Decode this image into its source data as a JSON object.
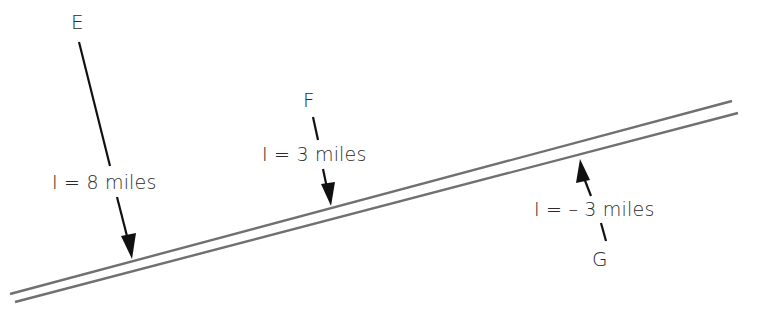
{
  "diagram": {
    "line": {
      "color": "#707070",
      "upper": {
        "x1": 10,
        "y1": 294,
        "x2": 732,
        "y2": 101
      },
      "lower": {
        "x1": 15,
        "y1": 302,
        "x2": 738,
        "y2": 113
      }
    },
    "arrow_color": "#111111",
    "points": [
      {
        "name": "E",
        "label": "E",
        "offset_label": "I = 8 miles"
      },
      {
        "name": "F",
        "label": "F",
        "offset_label": "I = 3 miles"
      },
      {
        "name": "G",
        "label": "G",
        "offset_label": "I = – 3 miles"
      }
    ]
  }
}
